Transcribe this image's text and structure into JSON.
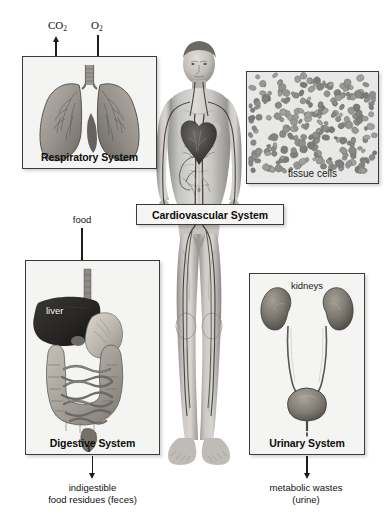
{
  "figure": {
    "background_color": "#ffffff",
    "ink_color": "#1c1c1c"
  },
  "center": {
    "label": "Cardiovascular System",
    "figure_name": "human-body-circulatory-figure"
  },
  "panels": {
    "respiratory": {
      "caption": "Respiratory System",
      "organ": "lungs"
    },
    "digestive": {
      "caption": "Digestive System",
      "organ": "liver-stomach-intestines",
      "inner_label": "liver"
    },
    "urinary": {
      "caption": "Urinary System",
      "organ": "kidneys-ureters-bladder",
      "inner_label": "kidneys"
    },
    "tissue": {
      "caption": "tissue cells",
      "organ": "tissue-cell-field"
    }
  },
  "annotations": {
    "co2": "CO",
    "co2_sub": "2",
    "o2": "O",
    "o2_sub": "2",
    "food": "food",
    "feces_line1": "indigestible",
    "feces_line2": "food residues (feces)",
    "urine_line1": "metabolic wastes",
    "urine_line2": "(urine)"
  },
  "colors": {
    "panel_fill": "#f4f4f2",
    "panel_border": "#3a3a3a",
    "text": "#111111",
    "arrow": "#1c1c1c",
    "tissue_fill": "#e9e9e7"
  }
}
